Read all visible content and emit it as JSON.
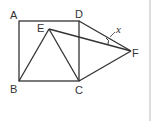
{
  "figure": {
    "labels": {
      "A": "A",
      "B": "B",
      "C": "C",
      "D": "D",
      "E": "E",
      "F": "F",
      "angle": "x"
    },
    "colors": {
      "stroke": "#333333",
      "border": "#bbbbbb",
      "background": "#ffffff"
    }
  }
}
